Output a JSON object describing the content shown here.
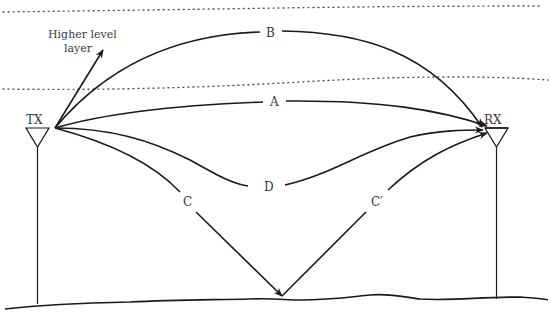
{
  "diagram": {
    "type": "radio propagation paths",
    "layer_label_line1": "Higher level",
    "layer_label_line2": "layer",
    "transmitter": {
      "label": "TX"
    },
    "receiver": {
      "label": "RX"
    },
    "paths": [
      {
        "id": "A",
        "label": "A",
        "description": "direct line-of-sight path"
      },
      {
        "id": "B",
        "label": "B",
        "description": "path reflected via higher layer"
      },
      {
        "id": "C",
        "label": "C",
        "description": "incident ground-reflected path"
      },
      {
        "id": "C_prime",
        "label": "C′",
        "description": "reflected ground path"
      },
      {
        "id": "D",
        "label": "D",
        "description": "refracted path through lower atmosphere"
      }
    ],
    "colors": {
      "stroke": "#1a1a1a",
      "text": "#3a3a3a",
      "background": "#ffffff"
    }
  }
}
